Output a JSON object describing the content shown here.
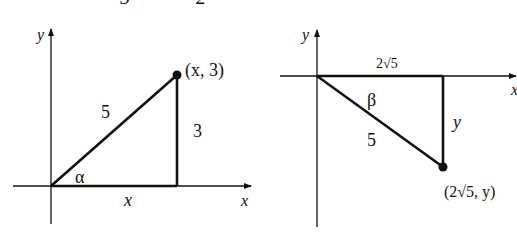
{
  "top_fragment": {
    "left_glyph": "5",
    "right_glyph": "2"
  },
  "figure_left": {
    "axis_x_label": "x",
    "axis_y_label": "y",
    "hypotenuse_label": "5",
    "vertical_side_label": "3",
    "horizontal_side_label": "x",
    "angle_label": "α",
    "point_label": "(x, 3)",
    "origin": [
      51,
      186
    ],
    "point": [
      177,
      75
    ]
  },
  "figure_right": {
    "axis_x_label": "x",
    "axis_y_label": "y",
    "hypotenuse_label": "5",
    "vertical_side_label": "y",
    "horizontal_side_label": "2√5",
    "angle_label": "β",
    "point_label": "(2√5, y)",
    "origin": [
      317,
      76
    ],
    "point": [
      443,
      167
    ]
  },
  "colors": {
    "ink": "#111111",
    "background": "#ffffff"
  }
}
